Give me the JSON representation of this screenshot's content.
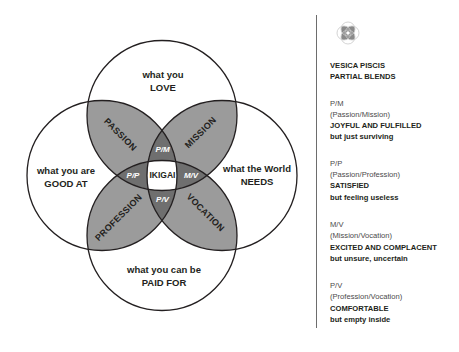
{
  "colors": {
    "stroke": "#231f20",
    "pair_overlap": "#9b9b9b",
    "triple_overlap": "#6f6f6f",
    "center": "#ffffff",
    "background": "#ffffff"
  },
  "diagram": {
    "circles": {
      "top": {
        "line1": "what you",
        "line2": "LOVE"
      },
      "left": {
        "line1": "what you are",
        "line2": "GOOD AT"
      },
      "right": {
        "line1": "what the World",
        "line2": "NEEDS"
      },
      "bottom": {
        "line1": "what you can be",
        "line2": "PAID FOR"
      }
    },
    "lenses": {
      "top_left": "PASSION",
      "top_right": "MISSION",
      "bottom_left": "PROFESSION",
      "bottom_right": "VOCATION"
    },
    "triples": {
      "top": "P/M",
      "left": "P/P",
      "right": "M/V",
      "bottom": "P/V"
    },
    "center": "IKIGAI"
  },
  "side_panel": {
    "icon": "vesica-piscis-icon",
    "heading_line1": "VESICA PISCIS",
    "heading_line2": "PARTIAL BLENDS",
    "blends": [
      {
        "code": "P/M",
        "pair": "(Passion/Mission)",
        "state": "JOYFUL AND FULFILLED",
        "but": "but just surviving"
      },
      {
        "code": "P/P",
        "pair": "(Passion/Profession)",
        "state": "SATISFIED",
        "but": "but feeling useless"
      },
      {
        "code": "M/V",
        "pair": "(Mission/Vocation)",
        "state": "EXCITED AND COMPLACENT",
        "but": "but unsure, uncertain"
      },
      {
        "code": "P/V",
        "pair": "(Profession/Vocation)",
        "state": "COMFORTABLE",
        "but": "but empty inside"
      }
    ]
  }
}
